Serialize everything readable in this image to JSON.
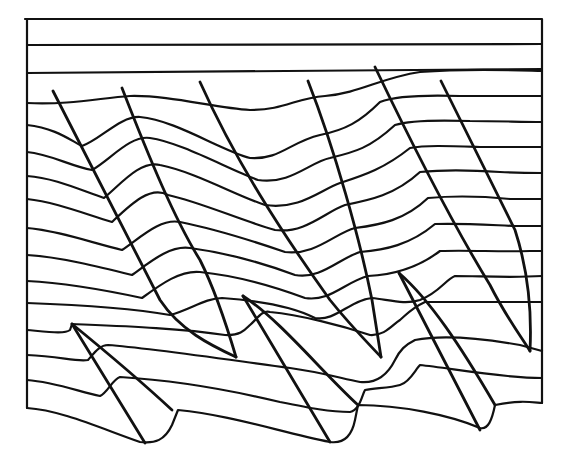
{
  "diagram": {
    "type": "geological-cross-section",
    "stroke_color": "#111111",
    "background": "#ffffff",
    "frame": "M25,19 L542,19 L542,403 M27,19 L27,408",
    "layers": [
      "M27,45 L542,44",
      "M27,73 C150,73 300,72 542,69",
      "M27,103 C70,105 100,98 130,96 C170,95 215,108 250,110 C285,110 295,98 325,96 C360,93 380,78 420,72 C470,68 510,70 542,71",
      "M27,125 C55,128 70,140 82,146 C100,140 120,116 140,117 C175,120 220,150 250,158 C280,160 290,142 320,135 C345,130 360,122 380,102 C395,96 430,95 460,96 C500,96 520,96 542,96",
      "M27,152 C50,154 70,166 92,170 C110,160 130,135 150,138 C180,142 230,170 258,180 C290,185 310,162 330,158 C355,152 370,148 395,125 C410,120 440,120 470,121 C500,121 520,122 542,122",
      "M27,176 C55,178 80,190 104,198 C120,185 140,160 160,165 C195,172 235,195 265,205 C300,210 320,190 340,183 C365,175 385,168 410,148 C425,145 450,146 480,147 C510,147 525,147 542,147",
      "M27,199 C55,202 85,214 112,222 C130,205 150,185 168,195 C200,202 240,220 275,230 C305,234 325,212 345,205 C370,200 395,195 420,172 C440,170 470,170 500,172 C520,173 532,173 542,173",
      "M27,228 C55,230 90,242 122,250 C140,238 160,218 180,222 C210,228 250,240 285,252 C315,256 335,233 355,228 C380,225 405,220 428,198 C450,196 480,196 510,199 C525,199 535,199 542,199",
      "M27,255 C60,257 100,267 132,275 C150,262 170,245 190,248 C220,252 260,262 295,275 C320,280 340,258 360,252 C385,250 410,245 435,224 C460,223 490,225 515,226 C530,226 537,226 542,226",
      "M27,281 C65,283 105,290 142,298 C160,285 180,270 200,272 C230,275 270,285 305,298 C330,302 345,282 368,276 C390,275 415,270 440,251 C470,250 500,252 530,251 L542,251",
      "M27,303 C80,305 130,308 170,315 C190,310 205,298 222,298 C250,300 290,305 315,318 C335,322 350,300 372,298 C390,300 405,305 420,300 C440,292 445,280 455,276 C480,276 510,278 542,276",
      "M27,330 C50,332 65,334 70,330 L72,324 C120,326 180,328 225,335 C240,336 245,330 250,325 C258,318 262,310 270,312 C300,315 340,325 370,335 C385,336 392,325 400,320 C408,313 412,308 425,302 L542,302",
      "M27,355 C60,356 75,362 88,360 C95,352 100,345 108,345 C150,348 230,360 290,368 C320,372 340,378 360,382 C380,384 390,370 395,360 C400,350 405,345 415,340 C440,335 480,338 520,345 L542,351",
      "M27,380 C55,382 80,392 100,396 C108,392 112,380 120,377 C170,380 230,390 280,402 C310,408 330,412 350,412 C360,410 362,395 365,390 C375,388 390,388 400,385 C410,382 415,370 420,365 C450,368 500,378 542,378",
      "M27,408 C60,410 100,428 140,442 C155,444 165,440 172,425 L178,410 C230,415 280,432 330,442 C345,444 352,435 355,420 L358,405 C400,405 450,415 480,428 C488,430 492,420 495,405 C520,400 530,402 542,403"
    ],
    "faults": [
      "M53,91 L160,300 C180,330 210,345 236,357",
      "M122,88 C150,160 175,220 200,260 C215,290 228,330 236,357",
      "M200,82 C235,160 280,230 330,300 C350,325 365,340 381,357",
      "M308,81 C335,150 360,240 372,300 L381,357",
      "M375,67 C410,140 450,220 490,285 C505,315 520,335 530,351",
      "M441,81 C465,130 490,180 515,230 C528,270 532,310 530,351",
      "M72,324 L145,443",
      "M72,324 C110,355 145,385 172,410",
      "M243,296 L330,442",
      "M243,296 C280,320 320,370 358,405",
      "M399,273 L480,430",
      "M399,273 C430,300 460,345 495,405"
    ]
  }
}
